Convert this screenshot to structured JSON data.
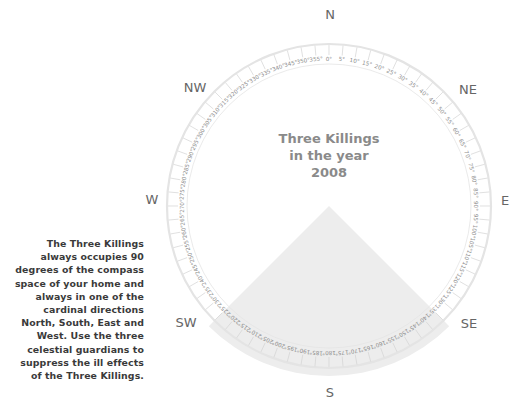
{
  "title": {
    "line1": "Three Killings",
    "line2": "in the year",
    "line3": "2008"
  },
  "description": "The Three Killings always occupies 90 degrees of the compass space of your home and always in one of the cardinal directions North, South, East and West. Use the three celestial guardians to suppress the ill effects of the Three Killings.",
  "directions": [
    {
      "label": "N",
      "x": 330,
      "y": 14
    },
    {
      "label": "NE",
      "x": 468,
      "y": 89
    },
    {
      "label": "E",
      "x": 505,
      "y": 200
    },
    {
      "label": "SE",
      "x": 469,
      "y": 323
    },
    {
      "label": "S",
      "x": 330,
      "y": 392
    },
    {
      "label": "SW",
      "x": 186,
      "y": 322
    },
    {
      "label": "W",
      "x": 152,
      "y": 199
    },
    {
      "label": "NW",
      "x": 195,
      "y": 87
    }
  ],
  "compass": {
    "center_x": 329,
    "center_y": 206,
    "outer_radius": 162,
    "inner_radius": 142,
    "degree_step": 5,
    "ring_color": "#e4e4e4",
    "tick_color": "#d2d2d2",
    "label_color": "#8c8c8c"
  },
  "three_killings": {
    "direction": "S",
    "start_deg": 135,
    "end_deg": 225,
    "span_deg": 90,
    "band_outer_radius": 170,
    "fill_color": "#ededed"
  }
}
